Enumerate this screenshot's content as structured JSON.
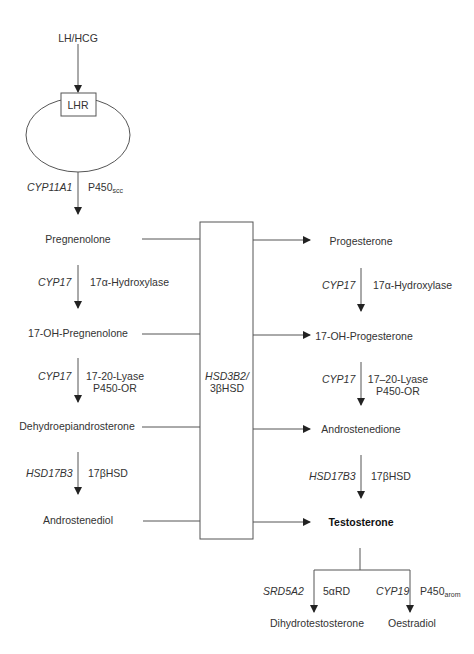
{
  "diagram": {
    "stimulus": "LH/HCG",
    "receptor": "LHR",
    "step0": {
      "gene": "CYP11A1",
      "enzyme_base": "P450",
      "enzyme_sub": "scc"
    },
    "left_column": [
      {
        "name": "Pregnenolone"
      },
      {
        "name": "17-OH-Pregnenolone"
      },
      {
        "name": "Dehydroepiandrosterone"
      },
      {
        "name": "Androstenediol"
      }
    ],
    "left_steps": [
      {
        "gene": "CYP17",
        "enzyme": "17α-Hydroxylase"
      },
      {
        "gene": "CYP17",
        "enzyme": "17-20-Lyase",
        "enzyme2": "P450-OR"
      },
      {
        "gene": "HSD17B3",
        "enzyme": "17βHSD"
      }
    ],
    "central_enzyme": {
      "gene": "HSD3B2/",
      "enzyme": "3βHSD"
    },
    "right_column": [
      {
        "name": "Progesterone"
      },
      {
        "name": "17-OH-Progesterone"
      },
      {
        "name": "Androstenedione"
      },
      {
        "name": "Testosterone"
      }
    ],
    "right_steps": [
      {
        "gene": "CYP17",
        "enzyme": "17α-Hydroxylase"
      },
      {
        "gene": "CYP17",
        "enzyme": "17–20-Lyase",
        "enzyme2": "P450-OR"
      },
      {
        "gene": "HSD17B3",
        "enzyme": "17βHSD"
      }
    ],
    "branches": [
      {
        "gene": "SRD5A2",
        "enzyme": "5αRD",
        "product": "Dihydrotestosterone"
      },
      {
        "gene": "CYP19",
        "enzyme_base": "P450",
        "enzyme_sub": "arom",
        "product": "Oestradiol"
      }
    ]
  }
}
